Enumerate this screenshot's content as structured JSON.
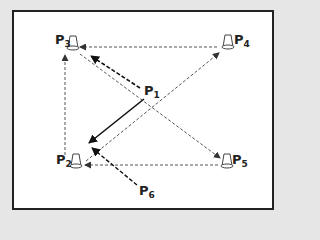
{
  "diagram": {
    "type": "drill-pattern",
    "colors": {
      "background": "#e6e6e6",
      "panel": "#ffffff",
      "border": "#222222",
      "ink": "#222222",
      "dashed": "#555555"
    },
    "nodes": [
      {
        "id": "P1",
        "prefix": "P",
        "sub": "1",
        "icon": "player",
        "x": 148,
        "y": 90
      },
      {
        "id": "P2",
        "prefix": "P",
        "sub": "2",
        "icon": "cone-icon",
        "x": 75,
        "y": 165
      },
      {
        "id": "P3",
        "prefix": "P",
        "sub": "3",
        "icon": "cone-icon",
        "x": 70,
        "y": 45
      },
      {
        "id": "P4",
        "prefix": "P",
        "sub": "4",
        "icon": "cone-icon",
        "x": 228,
        "y": 45
      },
      {
        "id": "P5",
        "prefix": "P",
        "sub": "5",
        "icon": "cone-icon",
        "x": 228,
        "y": 165
      },
      {
        "id": "P6",
        "prefix": "P",
        "sub": "6",
        "icon": "player",
        "x": 142,
        "y": 192
      }
    ],
    "edges": [
      {
        "from": "P1",
        "to": "P2",
        "style": "solid"
      },
      {
        "from": "P1",
        "to": "P3",
        "style": "dashed-bold"
      },
      {
        "from": "P6",
        "to": "P2",
        "style": "dashed-bold"
      },
      {
        "from": "P4",
        "to": "P3",
        "style": "dashed"
      },
      {
        "from": "P5",
        "to": "P2",
        "style": "dashed"
      },
      {
        "from": "P2",
        "to": "P3",
        "style": "dashed"
      },
      {
        "from": "P2",
        "to": "P4",
        "style": "dashed"
      },
      {
        "from": "P3",
        "to": "P5",
        "style": "dashed"
      }
    ]
  },
  "labels": {
    "p1": {
      "main": "P",
      "sub": "1"
    },
    "p2": {
      "main": "P",
      "sub": "2"
    },
    "p3": {
      "main": "P",
      "sub": "3"
    },
    "p4": {
      "main": "P",
      "sub": "4"
    },
    "p5": {
      "main": "P",
      "sub": "5"
    },
    "p6": {
      "main": "P",
      "sub": "6"
    }
  }
}
